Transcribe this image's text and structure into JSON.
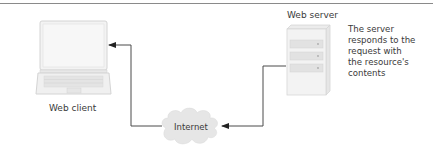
{
  "diagram": {
    "nodes": {
      "client": {
        "label": "Web client",
        "icon": "laptop-icon"
      },
      "server": {
        "label": "Web server",
        "icon": "server-icon"
      },
      "internet": {
        "label": "Internet",
        "icon": "cloud-icon"
      }
    },
    "note": {
      "lines": [
        "The server",
        "responds to the",
        "request with",
        "the resource's",
        "contents"
      ]
    },
    "edges": [
      {
        "from": "server",
        "to": "internet",
        "style": "arrow"
      },
      {
        "from": "internet",
        "to": "client",
        "style": "arrow"
      }
    ],
    "colors": {
      "line": "#4a4a4a",
      "device_fill": "#f2f2f2",
      "device_stroke": "#d8d8d8",
      "cloud_fill": "#e6e6e6",
      "text": "#3a3a3a",
      "rule": "#8a8a8a"
    }
  }
}
